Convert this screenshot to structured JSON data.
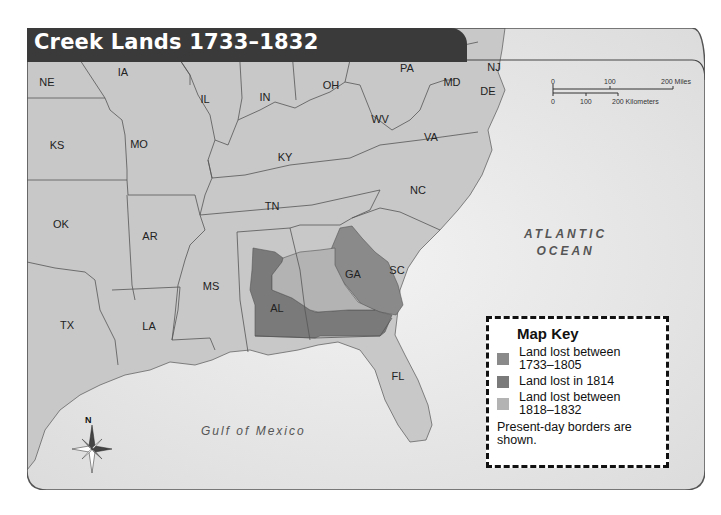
{
  "map": {
    "title": "Creek Lands 1733–1832",
    "states": [
      {
        "abbr": "NE",
        "x": 47,
        "y": 82
      },
      {
        "abbr": "IA",
        "x": 123,
        "y": 72
      },
      {
        "abbr": "IL",
        "x": 205,
        "y": 99
      },
      {
        "abbr": "IN",
        "x": 265,
        "y": 97
      },
      {
        "abbr": "OH",
        "x": 331,
        "y": 85
      },
      {
        "abbr": "PA",
        "x": 407,
        "y": 68
      },
      {
        "abbr": "NJ",
        "x": 494,
        "y": 67
      },
      {
        "abbr": "MD",
        "x": 452,
        "y": 82
      },
      {
        "abbr": "DE",
        "x": 488,
        "y": 91
      },
      {
        "abbr": "WV",
        "x": 380,
        "y": 119
      },
      {
        "abbr": "VA",
        "x": 431,
        "y": 137
      },
      {
        "abbr": "KS",
        "x": 57,
        "y": 145
      },
      {
        "abbr": "MO",
        "x": 139,
        "y": 144
      },
      {
        "abbr": "KY",
        "x": 285,
        "y": 157
      },
      {
        "abbr": "NC",
        "x": 418,
        "y": 190
      },
      {
        "abbr": "TN",
        "x": 272,
        "y": 206
      },
      {
        "abbr": "OK",
        "x": 61,
        "y": 224
      },
      {
        "abbr": "AR",
        "x": 150,
        "y": 236
      },
      {
        "abbr": "SC",
        "x": 397,
        "y": 270
      },
      {
        "abbr": "GA",
        "x": 353,
        "y": 274
      },
      {
        "abbr": "MS",
        "x": 211,
        "y": 286
      },
      {
        "abbr": "AL",
        "x": 277,
        "y": 308
      },
      {
        "abbr": "TX",
        "x": 67,
        "y": 325
      },
      {
        "abbr": "LA",
        "x": 149,
        "y": 326
      },
      {
        "abbr": "FL",
        "x": 398,
        "y": 376
      }
    ],
    "water_bodies": [
      {
        "name_line1": "ATLANTIC",
        "name_line2": "OCEAN"
      },
      {
        "name_line1": "Gulf of Mexico"
      }
    ],
    "scale_bar": {
      "miles_ticks": [
        "0",
        "100",
        "200 Miles"
      ],
      "km_ticks": [
        "0",
        "100",
        "200 Kilometers"
      ]
    },
    "compass": {
      "label": "N"
    },
    "legend": {
      "title": "Map Key",
      "items": [
        {
          "label": "Land lost between 1733–1805",
          "color": "#8a8a8a"
        },
        {
          "label": "Land lost in 1814",
          "color": "#7a7a7a"
        },
        {
          "label": "Land lost between 1818–1832",
          "color": "#b3b3b3"
        }
      ],
      "note": "Present-day borders are shown."
    },
    "colors": {
      "land": "#c8c8c8",
      "water": "#e8e8e8",
      "border": "#555555",
      "title_bar": "#3a3a3a"
    }
  }
}
